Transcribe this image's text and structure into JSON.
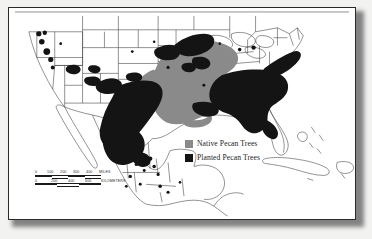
{
  "map": {
    "title": "Pecan Tree Distribution Map of North America",
    "legend": {
      "items": [
        {
          "label": "Native Pecan Trees",
          "color": "#8a8a8a",
          "swatch_name": "native-swatch"
        },
        {
          "label": "Planted Pecan Trees",
          "color": "#141414",
          "swatch_name": "planted-swatch"
        }
      ]
    },
    "scale": {
      "miles": {
        "ticks": [
          "0",
          "100",
          "200",
          "300",
          "400"
        ],
        "unit": "MILES"
      },
      "kilometers": {
        "ticks": [
          "0",
          "200",
          "400",
          "600"
        ],
        "unit": "KILOMETERS"
      }
    },
    "colors": {
      "native": "#8a8a8a",
      "planted": "#141414",
      "land": "#ffffff",
      "outline": "#3a3a3a",
      "frame": "#2a2a2a",
      "page": "#f2f2f0"
    }
  }
}
